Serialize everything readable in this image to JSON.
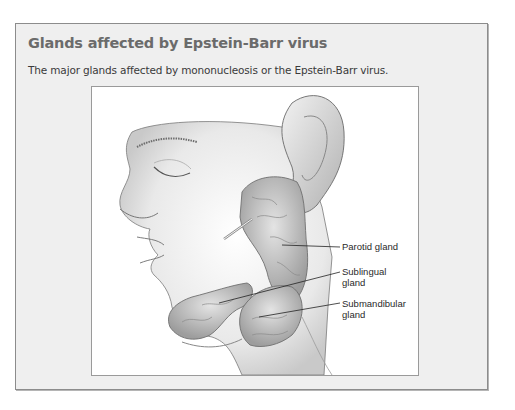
{
  "figure": {
    "title": "Glands affected by Epstein-Barr virus",
    "caption": "The major glands affected by mononucleosis or the Epstein-Barr virus."
  },
  "illustration": {
    "subject": "Side profile of head showing salivary glands",
    "labels": [
      {
        "line1": "Parotid gland",
        "line2": ""
      },
      {
        "line1": "Sublingual",
        "line2": "gland"
      },
      {
        "line1": "Submandibular",
        "line2": "gland"
      }
    ]
  },
  "colors": {
    "title": "#6b6b6b",
    "box_background": "#efefef",
    "box_border": "#8c8c8c"
  }
}
